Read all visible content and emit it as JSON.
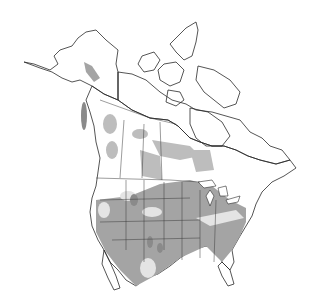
{
  "map": {
    "type": "range-map",
    "region": "North America",
    "colors": {
      "background": "#ffffff",
      "land_unshaded": "#ffffff",
      "range_light": "#e4e4e4",
      "range_medium": "#cfcfcf",
      "range_dark": "#a4a4a4",
      "range_darkest": "#8a8a8a",
      "outline": "#2a2a2a"
    },
    "legend": []
  }
}
